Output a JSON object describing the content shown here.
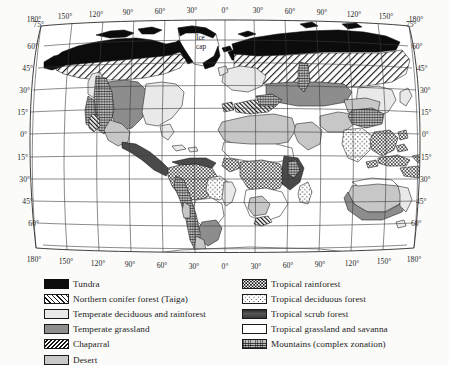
{
  "figure": {
    "projection": "curved-graticule world map"
  },
  "map": {
    "annotations": [
      {
        "name": "ice-cap",
        "line1": "Ice",
        "line2": "cap",
        "x": 204,
        "y": 38
      }
    ],
    "longitude_labels_top": [
      "180°",
      "150°",
      "120°",
      "90°",
      "60°",
      "30°",
      "0°",
      "30°",
      "60°",
      "90°",
      "120°",
      "150°",
      "180°"
    ],
    "longitude_labels_bottom": [
      "180°",
      "150°",
      "120°",
      "90°",
      "60°",
      "30°",
      "0°",
      "30°",
      "60°",
      "90°",
      "120°",
      "150°",
      "180°"
    ],
    "latitude_labels_left": [
      "75°",
      "60°",
      "45°",
      "30°",
      "15°",
      "0°",
      "15°",
      "30°",
      "45°",
      "60°"
    ],
    "latitude_labels_right": [
      "75°",
      "60°",
      "45°",
      "30°",
      "15°",
      "0°",
      "15°",
      "30°",
      "45°",
      "60°"
    ]
  },
  "legend": {
    "left_column": [
      {
        "label": "Tundra",
        "swatch": "sw-tundra"
      },
      {
        "label": "Northern conifer forest (Taiga)",
        "swatch": "sw-taiga"
      },
      {
        "label": "Temperate deciduous and rainforest",
        "swatch": "sw-tempdecid"
      },
      {
        "label": "Temperate grassland",
        "swatch": "sw-tempgrass"
      },
      {
        "label": "Chaparral",
        "swatch": "sw-chaparral"
      },
      {
        "label": "Desert",
        "swatch": "sw-desert"
      }
    ],
    "right_column": [
      {
        "label": "Tropical rainforest",
        "swatch": "sw-trainforest"
      },
      {
        "label": "Tropical deciduous forest",
        "swatch": "sw-tdecid"
      },
      {
        "label": "Tropical scrub forest",
        "swatch": "sw-tscrub"
      },
      {
        "label": "Tropical grassland and savanna",
        "swatch": "sw-tgrass"
      },
      {
        "label": "Mountains (complex zonation)",
        "swatch": "sw-mountains"
      }
    ]
  },
  "colors": {
    "background": "#fbfbfa",
    "ink": "#1a1a1a",
    "tundra": "#0d0d0d",
    "temperate_deciduous": "#e9e9e9",
    "temperate_grassland": "#8e8e8e",
    "desert": "#c8c8c8",
    "tropical_scrub": "#4a4a4a",
    "mountains": "#bdbdbd"
  }
}
